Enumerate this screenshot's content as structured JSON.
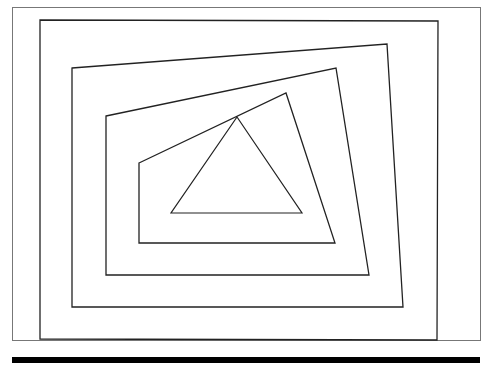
{
  "diagram": {
    "background": "#ffffff",
    "frame": {
      "x": 12,
      "y": 7,
      "width": 468,
      "height": 333,
      "stroke": "#777777",
      "stroke_width": 1
    },
    "bottom_bar": {
      "x": 12,
      "y": 357,
      "width": 468,
      "height": 6,
      "fill": "#000000"
    },
    "shapes": [
      {
        "name": "polygon-1",
        "stroke": "#222222",
        "stroke_width": 1.3,
        "points": [
          [
            40,
            20
          ],
          [
            438,
            21
          ],
          [
            437,
            340
          ],
          [
            40,
            339
          ]
        ]
      },
      {
        "name": "polygon-2",
        "stroke": "#222222",
        "stroke_width": 1.3,
        "points": [
          [
            72,
            68
          ],
          [
            387,
            44
          ],
          [
            403,
            307
          ],
          [
            72,
            307
          ]
        ]
      },
      {
        "name": "polygon-3",
        "stroke": "#222222",
        "stroke_width": 1.3,
        "points": [
          [
            106,
            116
          ],
          [
            336,
            68
          ],
          [
            369,
            275
          ],
          [
            106,
            275
          ]
        ]
      },
      {
        "name": "polygon-4",
        "stroke": "#222222",
        "stroke_width": 1.3,
        "points": [
          [
            139,
            163
          ],
          [
            286,
            93
          ],
          [
            335,
            243
          ],
          [
            139,
            243
          ]
        ]
      },
      {
        "name": "triangle",
        "stroke": "#222222",
        "stroke_width": 1.2,
        "points": [
          [
            237,
            117
          ],
          [
            302,
            213
          ],
          [
            171,
            213
          ]
        ]
      }
    ]
  }
}
